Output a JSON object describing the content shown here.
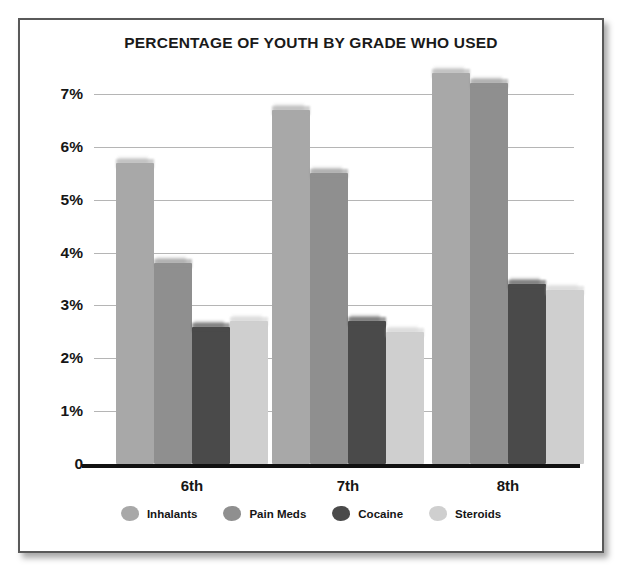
{
  "card": {
    "border_color": "#595959",
    "background": "#ffffff"
  },
  "chart_data": {
    "type": "bar",
    "title": "PERCENTAGE OF YOUTH BY GRADE WHO USED",
    "xlabel": "",
    "ylabel": "",
    "ylim": [
      0,
      7
    ],
    "grid": true,
    "legend_position": "bottom",
    "categories": [
      "6th",
      "7th",
      "8th"
    ],
    "ytick_labels": [
      "0",
      "1%",
      "2%",
      "3%",
      "4%",
      "5%",
      "6%",
      "7%"
    ],
    "ytick_values": [
      0,
      1,
      2,
      3,
      4,
      5,
      6,
      7
    ],
    "series": [
      {
        "name": "Inhalants",
        "color": "#a8a8a8",
        "values": [
          5.7,
          6.7,
          7.4
        ]
      },
      {
        "name": "Pain Meds",
        "color": "#8f8f8f",
        "values": [
          3.8,
          5.5,
          7.2
        ]
      },
      {
        "name": "Cocaine",
        "color": "#4a4a4a",
        "values": [
          2.6,
          2.7,
          3.4
        ]
      },
      {
        "name": "Steroids",
        "color": "#cfcfcf",
        "values": [
          2.7,
          2.5,
          3.3
        ]
      }
    ]
  }
}
